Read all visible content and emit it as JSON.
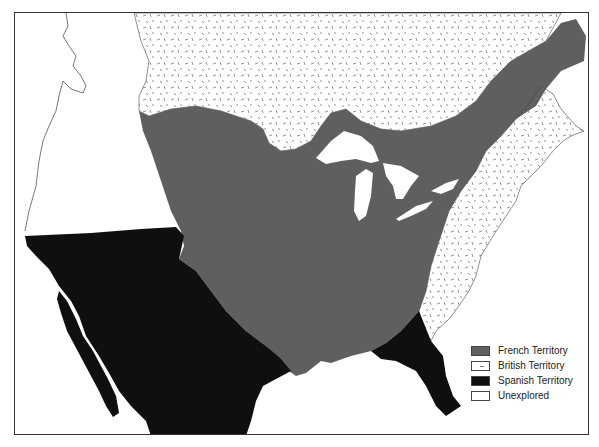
{
  "map": {
    "colors": {
      "french": "#5f5f5f",
      "british": "#ffffff",
      "spanish": "#0f0f0f",
      "unexplored": "#ffffff",
      "border": "#333333",
      "hatch": "#777777"
    },
    "regions": [
      "French Territory",
      "British Territory",
      "Spanish Territory",
      "Unexplored"
    ]
  },
  "legend": {
    "items": [
      {
        "label": "French Territory",
        "color": "#5f5f5f",
        "pattern": "solid"
      },
      {
        "label": "British Territory",
        "color": "#ffffff",
        "pattern": "dashes"
      },
      {
        "label": "Spanish Territory",
        "color": "#0f0f0f",
        "pattern": "solid"
      },
      {
        "label": "Unexplored",
        "color": "#ffffff",
        "pattern": "none"
      }
    ]
  }
}
